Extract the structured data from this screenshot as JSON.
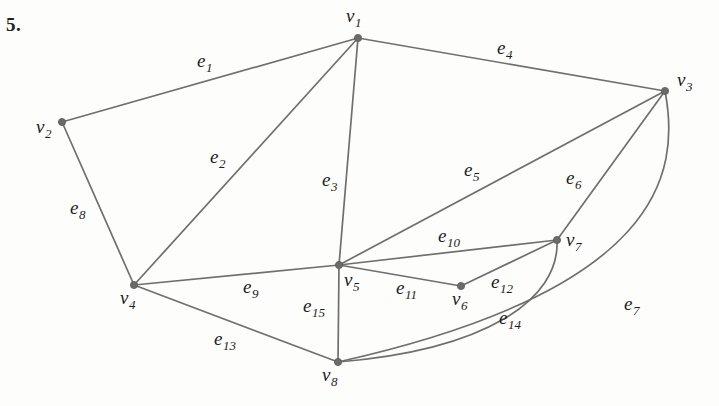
{
  "problem": {
    "number": "5."
  },
  "figure": {
    "type": "undirected-graph-diagram",
    "width": 719,
    "height": 406,
    "stroke_color": "#6f6f6f",
    "vertex_color": "#6b6b6b",
    "label_color": "#1d1d1d",
    "background": "#fdfdfc"
  },
  "vertices": [
    {
      "id": "v1",
      "base": "v",
      "sub": "1",
      "x": 358,
      "y": 38,
      "label_x": 346,
      "label_y": 6,
      "degree": 3
    },
    {
      "id": "v2",
      "base": "v",
      "sub": "2",
      "x": 62,
      "y": 122,
      "label_x": 36,
      "label_y": 117,
      "degree": 2
    },
    {
      "id": "v3",
      "base": "v",
      "sub": "3",
      "x": 665,
      "y": 91,
      "label_x": 677,
      "label_y": 70,
      "degree": 4
    },
    {
      "id": "v4",
      "base": "v",
      "sub": "4",
      "x": 134,
      "y": 285,
      "label_x": 120,
      "label_y": 288,
      "degree": 4
    },
    {
      "id": "v5",
      "base": "v",
      "sub": "5",
      "x": 339,
      "y": 265,
      "label_x": 344,
      "label_y": 270,
      "degree": 6
    },
    {
      "id": "v6",
      "base": "v",
      "sub": "6",
      "x": 461,
      "y": 286,
      "label_x": 452,
      "label_y": 289,
      "degree": 2
    },
    {
      "id": "v7",
      "base": "v",
      "sub": "7",
      "x": 557,
      "y": 240,
      "label_x": 566,
      "label_y": 230,
      "degree": 4
    },
    {
      "id": "v8",
      "base": "v",
      "sub": "8",
      "x": 338,
      "y": 362,
      "label_x": 322,
      "label_y": 365,
      "degree": 4
    }
  ],
  "edges": [
    {
      "id": "e1",
      "base": "e",
      "sub": "1",
      "from": "v2",
      "to": "v1",
      "shape": "line",
      "path": "M 62 122 L 358 38",
      "label_x": 197,
      "label_y": 51
    },
    {
      "id": "e2",
      "base": "e",
      "sub": "2",
      "from": "v4",
      "to": "v1",
      "shape": "line",
      "path": "M 134 285 L 358 38",
      "label_x": 210,
      "label_y": 147
    },
    {
      "id": "e3",
      "base": "e",
      "sub": "3",
      "from": "v1",
      "to": "v5",
      "shape": "line",
      "path": "M 358 38 L 339 265",
      "label_x": 322,
      "label_y": 170
    },
    {
      "id": "e4",
      "base": "e",
      "sub": "4",
      "from": "v1",
      "to": "v3",
      "shape": "line",
      "path": "M 358 38 L 665 91",
      "label_x": 497,
      "label_y": 38
    },
    {
      "id": "e5",
      "base": "e",
      "sub": "5",
      "from": "v5",
      "to": "v3",
      "shape": "line",
      "path": "M 339 265 L 665 91",
      "label_x": 464,
      "label_y": 160
    },
    {
      "id": "e6",
      "base": "e",
      "sub": "6",
      "from": "v7",
      "to": "v3",
      "shape": "line",
      "path": "M 557 240 L 665 91",
      "label_x": 566,
      "label_y": 168
    },
    {
      "id": "e7",
      "base": "e",
      "sub": "7",
      "from": "v3",
      "to": "v8",
      "shape": "curve",
      "path": "M 665 91 C 681 175, 660 290, 338 362",
      "label_x": 624,
      "label_y": 294
    },
    {
      "id": "e8",
      "base": "e",
      "sub": "8",
      "from": "v2",
      "to": "v4",
      "shape": "line",
      "path": "M 62 122 L 134 285",
      "label_x": 70,
      "label_y": 198
    },
    {
      "id": "e9",
      "base": "e",
      "sub": "9",
      "from": "v4",
      "to": "v5",
      "shape": "line",
      "path": "M 134 285 L 339 265",
      "label_x": 243,
      "label_y": 277
    },
    {
      "id": "e10",
      "base": "e",
      "sub": "10",
      "from": "v5",
      "to": "v7",
      "shape": "line",
      "path": "M 339 265 L 557 240",
      "label_x": 438,
      "label_y": 226
    },
    {
      "id": "e11",
      "base": "e",
      "sub": "11",
      "from": "v5",
      "to": "v6",
      "shape": "line",
      "path": "M 339 265 L 461 286",
      "label_x": 396,
      "label_y": 278
    },
    {
      "id": "e12",
      "base": "e",
      "sub": "12",
      "from": "v6",
      "to": "v7",
      "shape": "line",
      "path": "M 461 286 L 557 240",
      "label_x": 491,
      "label_y": 272
    },
    {
      "id": "e13",
      "base": "e",
      "sub": "13",
      "from": "v4",
      "to": "v8",
      "shape": "line",
      "path": "M 134 285 L 338 362",
      "label_x": 214,
      "label_y": 329
    },
    {
      "id": "e14",
      "base": "e",
      "sub": "14",
      "from": "v7",
      "to": "v8",
      "shape": "curve",
      "path": "M 557 240 C 560 300, 485 350, 338 362",
      "label_x": 499,
      "label_y": 308
    },
    {
      "id": "e15",
      "base": "e",
      "sub": "15",
      "from": "v5",
      "to": "v8",
      "shape": "line",
      "path": "M 339 265 L 338 362",
      "label_x": 303,
      "label_y": 296
    }
  ],
  "chart_data": {
    "type": "diagram",
    "title": "",
    "vertex_labels": [
      "v1",
      "v2",
      "v3",
      "v4",
      "v5",
      "v6",
      "v7",
      "v8"
    ],
    "edge_labels": [
      "e1",
      "e2",
      "e3",
      "e4",
      "e5",
      "e6",
      "e7",
      "e8",
      "e9",
      "e10",
      "e11",
      "e12",
      "e13",
      "e14",
      "e15"
    ],
    "edge_list": [
      [
        "e1",
        "v2",
        "v1"
      ],
      [
        "e2",
        "v4",
        "v1"
      ],
      [
        "e3",
        "v1",
        "v5"
      ],
      [
        "e4",
        "v1",
        "v3"
      ],
      [
        "e5",
        "v5",
        "v3"
      ],
      [
        "e6",
        "v7",
        "v3"
      ],
      [
        "e7",
        "v3",
        "v8"
      ],
      [
        "e8",
        "v2",
        "v4"
      ],
      [
        "e9",
        "v4",
        "v5"
      ],
      [
        "e10",
        "v5",
        "v7"
      ],
      [
        "e11",
        "v5",
        "v6"
      ],
      [
        "e12",
        "v6",
        "v7"
      ],
      [
        "e13",
        "v4",
        "v8"
      ],
      [
        "e14",
        "v7",
        "v8"
      ],
      [
        "e15",
        "v5",
        "v8"
      ]
    ],
    "degrees": {
      "v1": 3,
      "v2": 2,
      "v3": 4,
      "v4": 4,
      "v5": 6,
      "v6": 2,
      "v7": 4,
      "v8": 4
    }
  }
}
